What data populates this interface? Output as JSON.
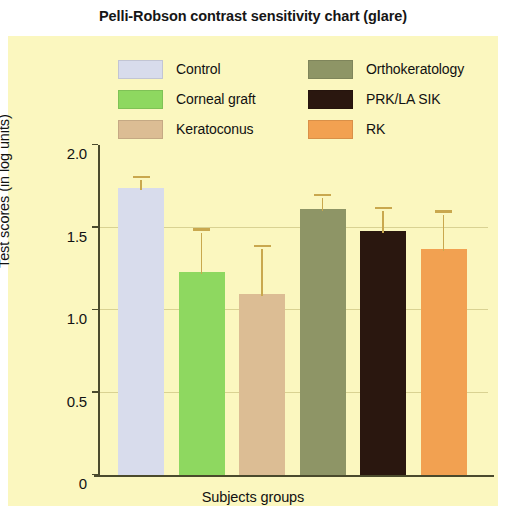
{
  "chart_data": {
    "type": "bar",
    "title": "Pelli-Robson contrast sensitivity chart (glare)",
    "xlabel": "Subjects groups",
    "ylabel": "Test scores (in log units)",
    "ylim": [
      0,
      2.0
    ],
    "yticks": [
      0,
      0.5,
      1.0,
      1.5,
      2.0
    ],
    "ytick_labels": [
      "0",
      "0.5",
      "1.0",
      "1.5",
      "2.0"
    ],
    "grid": true,
    "legend_position": "top",
    "xtick_labels": [],
    "categories": [
      "Control",
      "Corneal graft",
      "Keratoconus",
      "Orthokeratology",
      "PRK/LA SIK",
      "RK"
    ],
    "values": [
      1.74,
      1.23,
      1.1,
      1.61,
      1.48,
      1.37
    ],
    "errors": [
      0.06,
      0.25,
      0.28,
      0.08,
      0.13,
      0.22
    ],
    "colors": [
      "#d8dcec",
      "#8ed860",
      "#dcbd94",
      "#8e9566",
      "#2a170f",
      "#f2a151"
    ],
    "error_color": "#c9a84e",
    "background_color": "#fbf7bf",
    "axis_color": "#4a4a2c"
  },
  "legend": {
    "items": [
      {
        "label": "Control",
        "color": "#d8dcec"
      },
      {
        "label": "Corneal graft",
        "color": "#8ed860"
      },
      {
        "label": "Keratoconus",
        "color": "#dcbd94"
      },
      {
        "label": "Orthokeratology",
        "color": "#8e9566"
      },
      {
        "label": "PRK/LA SIK",
        "color": "#2a170f"
      },
      {
        "label": "RK",
        "color": "#f2a151"
      }
    ]
  }
}
